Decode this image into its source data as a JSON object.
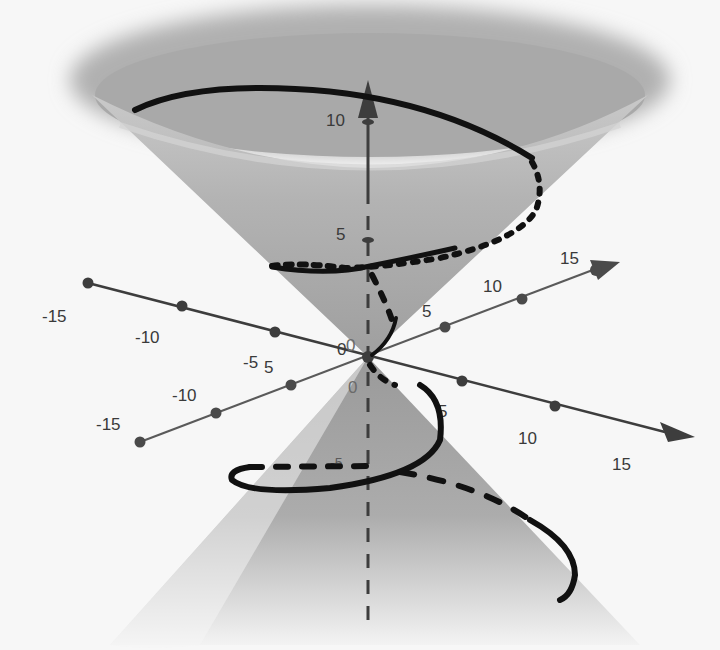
{
  "figure": {
    "type": "3d-surface-plot",
    "colors": {
      "background": "#f7f7f7",
      "cone_fill": "#a9a9a9",
      "cone_inner": "#bdbdbd",
      "helix": "#111111",
      "axis_dark": "#3d3d3d",
      "axis_light": "#5a5a5a"
    }
  },
  "axes": {
    "z": {
      "name": "z-axis",
      "ticks": [
        {
          "value": "10",
          "label": "10"
        },
        {
          "value": "5",
          "label": "5"
        },
        {
          "value": "0",
          "label": "0"
        },
        {
          "value": "-5",
          "label": "-5"
        }
      ]
    },
    "x": {
      "name": "x-axis",
      "ticks": [
        {
          "label": "-15"
        },
        {
          "label": "-10"
        },
        {
          "label": "-5"
        },
        {
          "label": "0"
        },
        {
          "label": "5"
        },
        {
          "label": "10"
        },
        {
          "label": "15"
        }
      ]
    },
    "y": {
      "name": "y-axis",
      "ticks": [
        {
          "label": "-15"
        },
        {
          "label": "-10"
        },
        {
          "label": "-5"
        },
        {
          "label": "0"
        },
        {
          "label": "5"
        },
        {
          "label": "10"
        },
        {
          "label": "15"
        }
      ]
    }
  },
  "labels": {
    "z10": "10",
    "z5": "5",
    "zneg5": "-5",
    "origin0a": "0",
    "origin0b": "0",
    "origin0c": "0",
    "x_neg15": "-15",
    "x_neg10": "-10",
    "x_neg5": "-5",
    "x_5": "5",
    "x_10": "10",
    "x_15": "15",
    "y_neg15": "-15",
    "y_neg10": "-10",
    "y_neg5": "5",
    "y_5": "5",
    "y_10": "10",
    "y_15": "15"
  }
}
